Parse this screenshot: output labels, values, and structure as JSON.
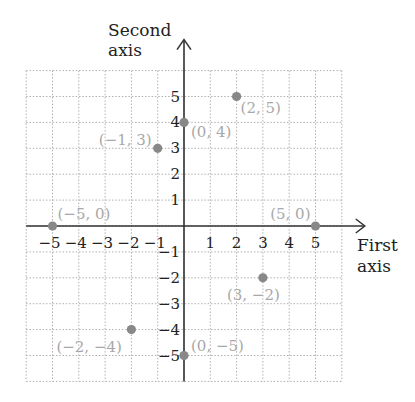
{
  "chart_data": {
    "type": "scatter",
    "title": "",
    "xlabel": "First axis",
    "ylabel": "Second axis",
    "xlabel_lines": [
      "First",
      "axis"
    ],
    "ylabel_lines": [
      "Second",
      "axis"
    ],
    "xlim": [
      -6,
      6
    ],
    "ylim": [
      -6,
      6
    ],
    "grid": true,
    "x_ticks": [
      -5,
      -4,
      -3,
      -2,
      -1,
      1,
      2,
      3,
      4,
      5
    ],
    "y_ticks": [
      -5,
      -4,
      -3,
      -2,
      -1,
      1,
      2,
      3,
      4,
      5
    ],
    "x_tick_labels": [
      "−5",
      "−4",
      "−3",
      "−2",
      "−1",
      "1",
      "2",
      "3",
      "4",
      "5"
    ],
    "y_tick_labels": [
      "−5",
      "−4",
      "−3",
      "−2",
      "−1",
      "1",
      "2",
      "3",
      "4",
      "5"
    ],
    "points": [
      {
        "x": 2,
        "y": 5,
        "label": "(2, 5)"
      },
      {
        "x": 0,
        "y": 4,
        "label": "(0, 4)"
      },
      {
        "x": -1,
        "y": 3,
        "label": "(−1, 3)"
      },
      {
        "x": -5,
        "y": 0,
        "label": "(−5, 0)"
      },
      {
        "x": 5,
        "y": 0,
        "label": "(5, 0)"
      },
      {
        "x": 3,
        "y": -2,
        "label": "(3, −2)"
      },
      {
        "x": -2,
        "y": -4,
        "label": "(−2, −4)"
      },
      {
        "x": 0,
        "y": -5,
        "label": "(0, −5)"
      }
    ],
    "colors": {
      "axis": "#333333",
      "grid": "#b0b0b0",
      "point": "#888888",
      "point_label": "#a8a8a8",
      "tick_label": "#222222"
    }
  }
}
